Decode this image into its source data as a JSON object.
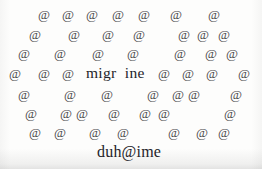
{
  "image": {
    "kind": "captcha",
    "width": 262,
    "height": 169,
    "background_color": "#fdfdfc"
  },
  "colors": {
    "noise_glyph": "#4a4a4c",
    "word_text": "#24242a",
    "background": "#fdfdfc"
  },
  "captcha": {
    "challenge_word": "migr  ine",
    "answer_word": "duh@ime",
    "noise_character": "@"
  },
  "layout": {
    "challenge_word_position": {
      "x": 86,
      "y": 65
    },
    "answer_word_position": {
      "x": 97,
      "y": 144
    }
  },
  "noise_rows": [
    {
      "row": 1,
      "y": 8,
      "glyphs": [
        {
          "char": "@",
          "x": 38
        },
        {
          "char": "@",
          "x": 62
        },
        {
          "char": "@",
          "x": 86
        },
        {
          "char": "@",
          "x": 112
        },
        {
          "char": "@",
          "x": 138
        },
        {
          "char": "@",
          "x": 170
        },
        {
          "char": "@",
          "x": 208
        }
      ]
    },
    {
      "row": 2,
      "y": 28,
      "glyphs": [
        {
          "char": "@",
          "x": 29
        },
        {
          "char": "@",
          "x": 68
        },
        {
          "char": "@",
          "x": 102
        },
        {
          "char": "@",
          "x": 133
        },
        {
          "char": "@",
          "x": 178
        },
        {
          "char": "@",
          "x": 197
        },
        {
          "char": "@",
          "x": 218
        }
      ]
    },
    {
      "row": 3,
      "y": 47,
      "glyphs": [
        {
          "char": "@",
          "x": 18
        },
        {
          "char": "@",
          "x": 54
        },
        {
          "char": "@",
          "x": 92
        },
        {
          "char": "@",
          "x": 127
        },
        {
          "char": "@",
          "x": 174
        },
        {
          "char": "@",
          "x": 205
        },
        {
          "char": "@",
          "x": 226
        }
      ]
    },
    {
      "row": 4,
      "y": 67,
      "glyphs": [
        {
          "char": "@",
          "x": 9
        },
        {
          "char": "@",
          "x": 38
        },
        {
          "char": "@",
          "x": 62
        },
        {
          "char": "@",
          "x": 158
        },
        {
          "char": "@",
          "x": 182
        },
        {
          "char": "@",
          "x": 206
        },
        {
          "char": "@",
          "x": 238
        }
      ]
    },
    {
      "row": 5,
      "y": 88,
      "glyphs": [
        {
          "char": "@",
          "x": 18
        },
        {
          "char": "@",
          "x": 64
        },
        {
          "char": "@",
          "x": 101
        },
        {
          "char": "@",
          "x": 147
        },
        {
          "char": "@",
          "x": 172
        },
        {
          "char": "@",
          "x": 188
        },
        {
          "char": "@",
          "x": 230
        }
      ]
    },
    {
      "row": 6,
      "y": 107,
      "glyphs": [
        {
          "char": "@",
          "x": 25
        },
        {
          "char": "@",
          "x": 60
        },
        {
          "char": "@",
          "x": 76
        },
        {
          "char": "@",
          "x": 108
        },
        {
          "char": "@",
          "x": 139
        },
        {
          "char": "@",
          "x": 158
        },
        {
          "char": "@",
          "x": 224
        }
      ]
    },
    {
      "row": 7,
      "y": 126,
      "glyphs": [
        {
          "char": "@",
          "x": 29
        },
        {
          "char": "@",
          "x": 54
        },
        {
          "char": "@",
          "x": 89
        },
        {
          "char": "@",
          "x": 117
        },
        {
          "char": "@",
          "x": 168
        },
        {
          "char": "@",
          "x": 196
        },
        {
          "char": "@",
          "x": 218
        }
      ]
    }
  ]
}
